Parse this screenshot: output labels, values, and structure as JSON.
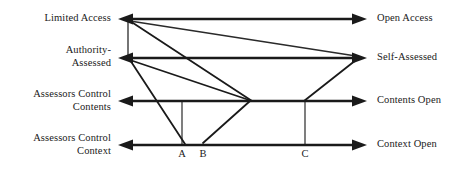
{
  "figure": {
    "type": "diagram",
    "background_color": "#ffffff",
    "line_color": "#1a1a1a"
  },
  "axes": [
    {
      "id": "axis-1",
      "left_label": "Limited Access",
      "right_label": "Open Access",
      "y": 19,
      "x_start": 125,
      "x_end": 362
    },
    {
      "id": "axis-2",
      "left_label": "Authority-\nAssessed",
      "right_label": "Self-Assessed",
      "y": 58,
      "x_start": 125,
      "x_end": 362
    },
    {
      "id": "axis-3",
      "left_label": "Assessors Control\nContents",
      "right_label": "Contents Open",
      "y": 101,
      "x_start": 125,
      "x_end": 362
    },
    {
      "id": "axis-4",
      "left_label": "Assessors Control\nContext",
      "right_label": "Context Open",
      "y": 145,
      "x_start": 125,
      "x_end": 362
    }
  ],
  "point_markers": [
    {
      "id": "marker-a",
      "label": "A",
      "x": 182,
      "label_y": 148
    },
    {
      "id": "marker-b",
      "label": "B",
      "x": 203,
      "label_y": 148
    },
    {
      "id": "marker-c",
      "label": "C",
      "x": 305,
      "label_y": 148
    }
  ],
  "vertical_connectors": [
    {
      "id": "connector-left",
      "x": 128,
      "y_top": 19,
      "y_bottom": 58
    },
    {
      "id": "connector-a",
      "x": 182,
      "y_top": 101,
      "y_bottom": 145
    },
    {
      "id": "connector-c",
      "x": 305,
      "y_top": 101,
      "y_bottom": 145
    }
  ],
  "diagonals": [
    {
      "id": "diagonal-limited-to-self",
      "from_x": 130,
      "from_y": 21,
      "to_x": 358,
      "to_y": 57,
      "note": "Limited Access origin to Self-Assessed terminus"
    },
    {
      "id": "diagonal-limited-to-contents",
      "from_x": 130,
      "from_y": 21,
      "to_x": 252,
      "to_y": 101,
      "note": "Limited Access origin down to Contents Open convergence"
    },
    {
      "id": "diagonal-authority-to-contents",
      "from_x": 130,
      "from_y": 60,
      "to_x": 186,
      "to_y": 145,
      "note": "Authority-Assessed origin down to point A on bottom axis"
    },
    {
      "id": "diagonal-authority-to-convergence",
      "from_x": 130,
      "from_y": 60,
      "to_x": 252,
      "to_y": 101,
      "note": "Authority-Assessed origin down to Contents Open convergence"
    },
    {
      "id": "diagonal-b-upward",
      "from_x": 203,
      "from_y": 143,
      "to_x": 250,
      "to_y": 101,
      "note": "Point B rising to the Contents Open convergence"
    },
    {
      "id": "diagonal-c-to-self",
      "from_x": 303,
      "from_y": 101,
      "to_x": 358,
      "to_y": 60,
      "note": "Point C on Contents axis rising to Self-Assessed terminus"
    }
  ],
  "convergence_point": {
    "id": "contents-convergence",
    "x": 252,
    "y": 101
  }
}
